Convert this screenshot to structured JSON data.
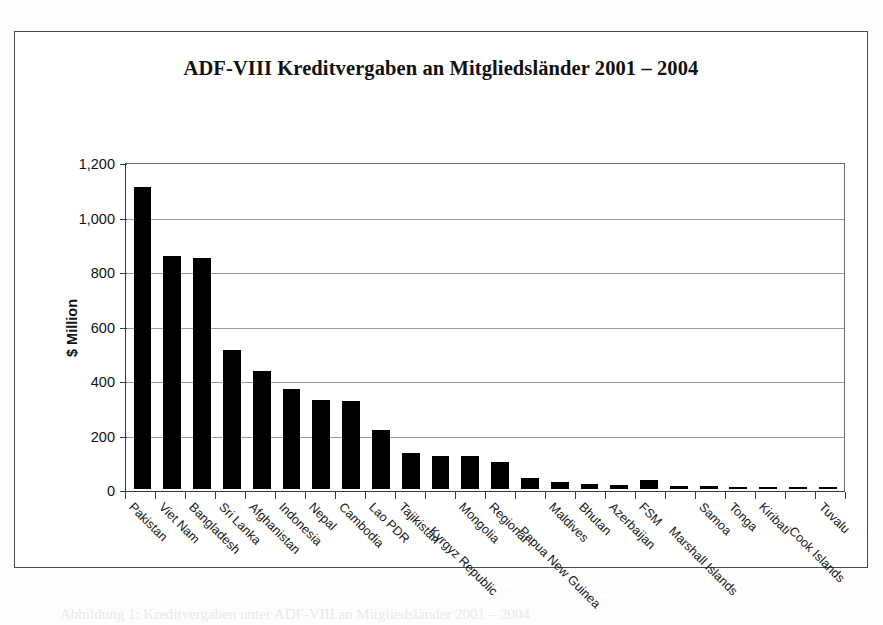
{
  "chart_data": {
    "type": "bar",
    "title": "ADF-VIII Kreditvergaben an Mitgliedsländer 2001 – 2004",
    "xlabel": "",
    "ylabel": "$ Million",
    "ylim": [
      0,
      1200
    ],
    "ytick_step": 200,
    "ytick_labels": [
      "0",
      "200",
      "400",
      "600",
      "800",
      "1,000",
      "1,200"
    ],
    "ytick_values": [
      0,
      200,
      400,
      600,
      800,
      1000,
      1200
    ],
    "grid": "horizontal",
    "legend": "none",
    "bar_color": "#000000",
    "categories": [
      "Pakistan",
      "Viet Nam",
      "Bangladesh",
      "Sri Lanka",
      "Afghanistan",
      "Indonesia",
      "Nepal",
      "Cambodia",
      "Lao PDR",
      "Tajikistan",
      "Kyrgyz Republic",
      "Mongolia",
      "Regional",
      "Papua New Guinea",
      "Maldives",
      "Bhutan",
      "Azerbaijan",
      "FSM",
      "Marshall Islands",
      "Samoa",
      "Tonga",
      "Kiribati",
      "Cook Islands",
      "Tuvalu"
    ],
    "values": [
      1115,
      860,
      855,
      515,
      435,
      370,
      330,
      325,
      220,
      135,
      122,
      122,
      102,
      42,
      28,
      20,
      17,
      33,
      13,
      11,
      10,
      10,
      4,
      2
    ]
  },
  "caption": {
    "text": "Abbildung 1: Kreditvergaben unter ADF-VIII an Mitgliedsländer 2001 – 2004"
  }
}
